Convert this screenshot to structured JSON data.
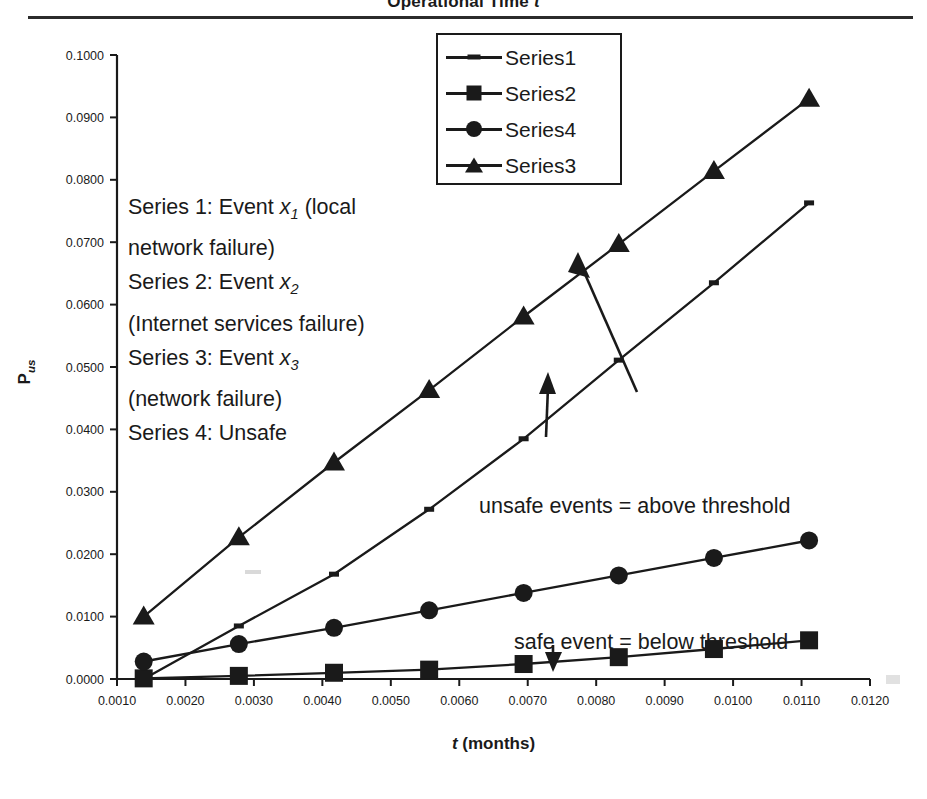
{
  "header": {
    "title_prefix": "Operational Time ",
    "title_var": "t"
  },
  "legend": {
    "items": [
      {
        "label": "Series1",
        "marker": "dash"
      },
      {
        "label": "Series2",
        "marker": "square"
      },
      {
        "label": "Series4",
        "marker": "circle"
      },
      {
        "label": "Series3",
        "marker": "triangle"
      }
    ]
  },
  "notes": {
    "lines": [
      {
        "pre": "Series 1: Event ",
        "var": "x",
        "sub": "1",
        "post": " (local"
      },
      {
        "pre": "network failure)",
        "var": "",
        "sub": "",
        "post": ""
      },
      {
        "pre": "Series 2: Event ",
        "var": "x",
        "sub": "2",
        "post": ""
      },
      {
        "pre": "(Internet services failure)",
        "var": "",
        "sub": "",
        "post": ""
      },
      {
        "pre": "Series 3: Event ",
        "var": "x",
        "sub": "3",
        "post": ""
      },
      {
        "pre": "(network failure)",
        "var": "",
        "sub": "",
        "post": ""
      },
      {
        "pre": "Series 4: Unsafe",
        "var": "",
        "sub": "",
        "post": ""
      }
    ],
    "unsafe_annotation": "unsafe events = above threshold",
    "safe_annotation": "safe event = below threshold"
  },
  "chart_data": {
    "type": "line",
    "title": "Operational Time t",
    "xlabel": "t (months)",
    "ylabel": "P us",
    "xlim": [
      0.001,
      0.012
    ],
    "ylim": [
      0.0,
      0.1
    ],
    "grid": false,
    "legend_position": "top-center",
    "x_ticks": [
      "0.0010",
      "0.0020",
      "0.0030",
      "0.0040",
      "0.0050",
      "0.0060",
      "0.0070",
      "0.0080",
      "0.0090",
      "0.0100",
      "0.0110",
      "0.0120"
    ],
    "x_tick_values": [
      0.001,
      0.002,
      0.003,
      0.004,
      0.005,
      0.006,
      0.007,
      0.008,
      0.009,
      0.01,
      0.011,
      0.012
    ],
    "y_ticks": [
      "0.0000",
      "0.0100",
      "0.0200",
      "0.0300",
      "0.0400",
      "0.0500",
      "0.0600",
      "0.0700",
      "0.0800",
      "0.0900",
      "0.1000"
    ],
    "y_tick_values": [
      0.0,
      0.01,
      0.02,
      0.03,
      0.04,
      0.05,
      0.06,
      0.07,
      0.08,
      0.09,
      0.1
    ],
    "x": [
      0.00139,
      0.00278,
      0.00417,
      0.00556,
      0.00694,
      0.00833,
      0.00972,
      0.01111
    ],
    "series": [
      {
        "name": "Series1",
        "marker": "dash",
        "description": "Event x1 (local network failure)",
        "values": [
          0.0,
          0.0085,
          0.0168,
          0.0272,
          0.0385,
          0.0511,
          0.0635,
          0.0763
        ]
      },
      {
        "name": "Series2",
        "marker": "square",
        "description": "Event x2 (Internet services failure)",
        "values": [
          0.0001,
          0.0005,
          0.001,
          0.0015,
          0.0024,
          0.0035,
          0.0048,
          0.0062
        ]
      },
      {
        "name": "Series4",
        "marker": "circle",
        "description": "Unsafe",
        "values": [
          0.0028,
          0.0056,
          0.0082,
          0.011,
          0.0138,
          0.0166,
          0.0194,
          0.0222
        ]
      },
      {
        "name": "Series3",
        "marker": "triangle",
        "description": "Event x3 (network failure)",
        "values": [
          0.01,
          0.0227,
          0.0347,
          0.0463,
          0.0581,
          0.0697,
          0.0814,
          0.093
        ]
      }
    ]
  }
}
